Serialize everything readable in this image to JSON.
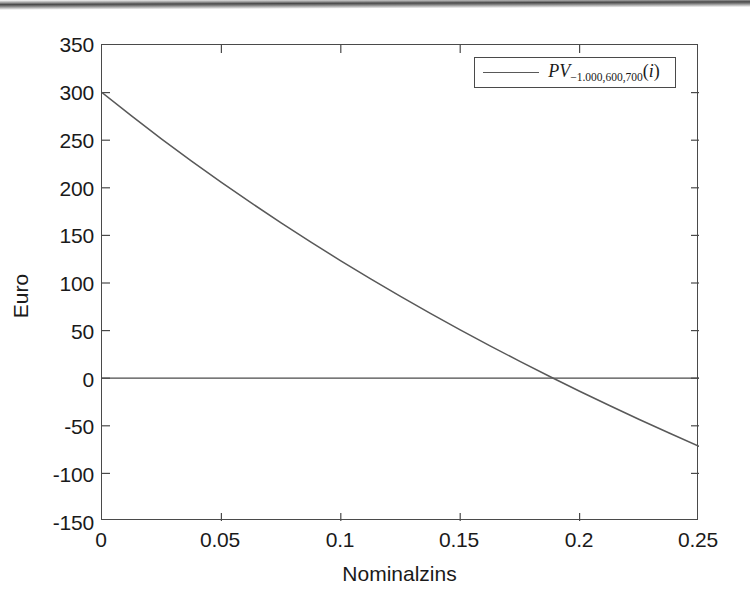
{
  "figure": {
    "background_color": "#ffffff",
    "axis_color": "#4a4a4a",
    "line_color": "#595959"
  },
  "axes": {
    "ylabel": "Euro",
    "xlabel": "Nominalzins",
    "ytick_labels": [
      "350",
      "300",
      "250",
      "200",
      "150",
      "100",
      "50",
      "0",
      "-50",
      "-100",
      "-150"
    ],
    "xtick_labels": [
      "0",
      "0.05",
      "0.1",
      "0.15",
      "0.2",
      "0.25"
    ]
  },
  "legend": {
    "base": "PV",
    "subscript": "−1.000,600,700",
    "argument_open": "(",
    "argument_var": "i",
    "argument_close": ")",
    "full_label": "PV_{-1.000,600,700}(i)"
  },
  "chart_data": {
    "type": "line",
    "title": "",
    "xlabel": "Nominalzins",
    "ylabel": "Euro",
    "xlim": [
      0,
      0.25
    ],
    "ylim": [
      -150,
      350
    ],
    "xticks": [
      0,
      0.05,
      0.1,
      0.15,
      0.2,
      0.25
    ],
    "yticks": [
      -150,
      -100,
      -50,
      0,
      50,
      100,
      150,
      200,
      250,
      300,
      350
    ],
    "grid": false,
    "legend_position": "upper right",
    "zero_line": 0,
    "annotations": [
      {
        "label": "IRR (zero crossing)",
        "x": 0.188,
        "y": 0
      }
    ],
    "series": [
      {
        "name": "PV_{-1.000,600,700}(i)",
        "color": "#595959",
        "x": [
          0,
          0.0125,
          0.025,
          0.0375,
          0.05,
          0.0625,
          0.075,
          0.0875,
          0.1,
          0.1125,
          0.125,
          0.1375,
          0.15,
          0.1625,
          0.175,
          0.1875,
          0.2,
          0.2125,
          0.225,
          0.2375,
          0.25
        ],
        "y": [
          300.0,
          275.2,
          251.2,
          228.1,
          205.7,
          184.1,
          163.2,
          142.9,
          123.3,
          104.3,
          85.9,
          68.1,
          50.8,
          34.0,
          17.6,
          1.8,
          -13.7,
          -28.7,
          -43.4,
          -57.6,
          -71.5
        ]
      }
    ]
  }
}
